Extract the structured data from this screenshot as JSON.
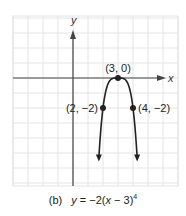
{
  "chart_data": {
    "type": "line",
    "title": "",
    "panel_label": "(b)",
    "equation": "y = −2(x − 3)^4",
    "equation_parts": {
      "lhs": "y",
      "eq": " = ",
      "coef": "−2(",
      "var": "x",
      "rest": " − 3)",
      "exp": "4"
    },
    "xlabel": "x",
    "ylabel": "y",
    "xlim": [
      -4,
      7
    ],
    "ylim": [
      -7.2,
      4.2
    ],
    "grid": true,
    "grid_step": 1,
    "series": [
      {
        "name": "y = -2(x-3)^4",
        "function": "-2*(x-3)^4",
        "x": [
          2.0,
          2.2,
          2.4,
          2.6,
          2.8,
          3.0,
          3.2,
          3.4,
          3.6,
          3.8,
          4.0
        ],
        "y": [
          -2.0,
          -0.82,
          -0.26,
          -0.05,
          0.0,
          0.0,
          0.0,
          -0.05,
          -0.26,
          -0.82,
          -2.0
        ],
        "extends_to_y": -5.3,
        "arrows_at_ends": true
      }
    ],
    "labeled_points": [
      {
        "label": "(3, 0)",
        "x": 3,
        "y": 0
      },
      {
        "label": "(2, −2)",
        "x": 2,
        "y": -2
      },
      {
        "label": "(4, −2)",
        "x": 4,
        "y": -2
      }
    ]
  },
  "colors": {
    "grid": "#e4e4e4",
    "axis": "#444444",
    "curve": "#222222",
    "text": "#222222"
  }
}
